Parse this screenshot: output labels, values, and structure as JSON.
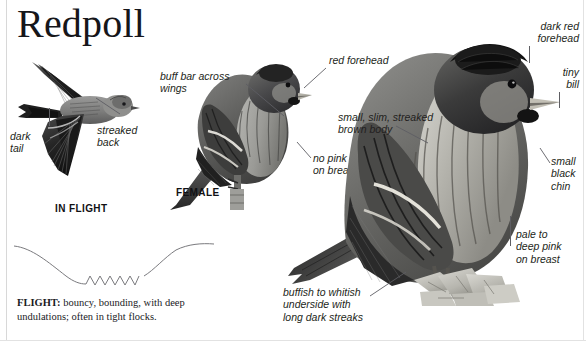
{
  "title": "Redpoll",
  "captions": {
    "in_flight": "IN FLIGHT",
    "female": "FEMALE"
  },
  "annotations": {
    "dark_tail": "dark\ntail",
    "streaked_back": "streaked\nback",
    "buff_bar": "buff bar across\nwings",
    "red_forehead": "red forehead",
    "no_pink": "no pink\non breast",
    "small_slim": "small, slim, streaked\nbrown body",
    "dark_red_forehead": "dark red\nforehead",
    "tiny_bill": "tiny\nbill",
    "small_black_chin": "small\nblack\nchin",
    "pale_to_deep_pink": "pale to\ndeep pink\non breast",
    "buffish_underside": "buffish to whitish\nunderside with\nlong dark streaks"
  },
  "flight_note": {
    "label": "FLIGHT:",
    "text": " bouncy, bounding, with deep undulations; often in tight flocks."
  },
  "colors": {
    "ink": "#231f20",
    "leader": "#5e5e63",
    "border": "#d8d8d8",
    "plumage_dark": "#3a3a3c",
    "plumage_mid": "#8d8d8f",
    "plumage_light": "#d6d6d4",
    "background": "#ffffff"
  }
}
